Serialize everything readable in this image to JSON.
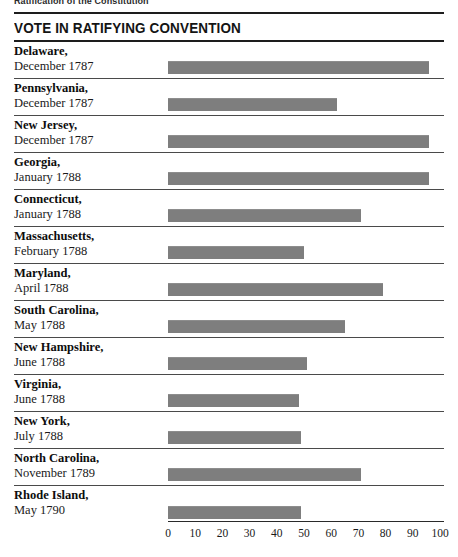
{
  "page": {
    "running_head": "Ratification of the Constitution",
    "section_title": "VOTE IN RATIFYING CONVENTION"
  },
  "chart_data": {
    "type": "bar",
    "orientation": "horizontal",
    "title": "VOTE IN RATIFYING CONVENTION",
    "xlabel": "",
    "ylabel": "",
    "xlim": [
      0,
      100
    ],
    "xticks": [
      0,
      10,
      20,
      30,
      40,
      50,
      60,
      70,
      80,
      90,
      100
    ],
    "grid": false,
    "legend": "none",
    "bar_color": "#7e7e7e",
    "categories": [
      "Delaware",
      "Pennsylvania",
      "New Jersey",
      "Georgia",
      "Connecticut",
      "Massachusetts",
      "Maryland",
      "South Carolina",
      "New Hampshire",
      "Virginia",
      "New York",
      "North Carolina",
      "Rhode Island"
    ],
    "values": [
      96,
      62,
      96,
      96,
      71,
      50,
      79,
      65,
      51,
      48,
      49,
      71,
      49
    ],
    "rows": [
      {
        "state": "Delaware,",
        "date": "December 1787",
        "value": 96
      },
      {
        "state": "Pennsylvania,",
        "date": "December 1787",
        "value": 62
      },
      {
        "state": "New Jersey,",
        "date": "December 1787",
        "value": 96
      },
      {
        "state": "Georgia,",
        "date": "January 1788",
        "value": 96
      },
      {
        "state": "Connecticut,",
        "date": "January 1788",
        "value": 71
      },
      {
        "state": "Massachusetts,",
        "date": "February 1788",
        "value": 50
      },
      {
        "state": "Maryland,",
        "date": "April 1788",
        "value": 79
      },
      {
        "state": "South Carolina,",
        "date": "May 1788",
        "value": 65
      },
      {
        "state": "New Hampshire,",
        "date": "June 1788",
        "value": 51
      },
      {
        "state": "Virginia,",
        "date": "June 1788",
        "value": 48
      },
      {
        "state": "New York,",
        "date": "July 1788",
        "value": 49
      },
      {
        "state": "North Carolina,",
        "date": "November 1789",
        "value": 71
      },
      {
        "state": "Rhode Island,",
        "date": "May 1790",
        "value": 49
      }
    ]
  }
}
